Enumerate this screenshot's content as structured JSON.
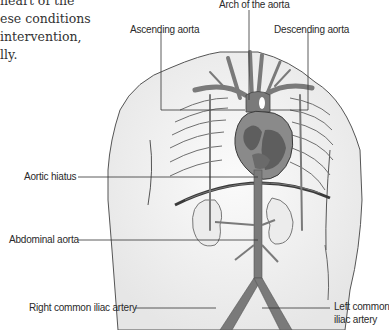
{
  "intro_text": {
    "lines": [
      "heart of the",
      "ese conditions",
      "intervention,",
      "lly."
    ]
  },
  "diagram": {
    "labels": {
      "arch": "Arch of the aorta",
      "ascending": "Ascending aorta",
      "descending": "Descending aorta",
      "hiatus": "Aortic hiatus",
      "abdominal": "Abdominal aorta",
      "right_iliac": "Right common iliac artery",
      "left_iliac_1": "Left common",
      "left_iliac_2": "iliac artery"
    },
    "colors": {
      "artery": "#7a7a7a",
      "heart_dark": "#5e5e5e",
      "heart_light": "#9a9a9a",
      "body_fill": "#f2f2f2",
      "outline": "#3a3a3a",
      "leader": "#333333"
    }
  }
}
